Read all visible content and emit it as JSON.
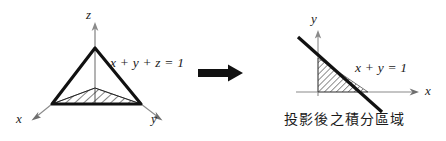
{
  "figure": {
    "background": "#ffffff",
    "ink": "#1a1a1a",
    "width": 446,
    "height": 141
  },
  "left_diagram": {
    "name": "3d-tetrahedron-plane",
    "axes": [
      {
        "id": "z",
        "label": "z",
        "direction": "up"
      },
      {
        "id": "x",
        "label": "x",
        "direction": "down-left"
      },
      {
        "id": "y",
        "label": "y",
        "direction": "down-right"
      }
    ],
    "equation": "x + y + z = 1",
    "shaded_region": "hatched triangular base in xy-plane"
  },
  "transform_arrow": {
    "name": "projection-arrow",
    "direction": "right",
    "color": "#111111"
  },
  "right_diagram": {
    "name": "2d-projection-region",
    "axes": [
      {
        "id": "y",
        "label": "y",
        "direction": "up"
      },
      {
        "id": "x",
        "label": "x",
        "direction": "right"
      }
    ],
    "equation": "x + y = 1",
    "shaded_region": "hatched right triangle bounded by axes and line",
    "caption": "投影後之積分區域"
  }
}
